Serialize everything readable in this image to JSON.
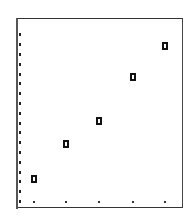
{
  "chart_data": {
    "type": "scatter",
    "title": "",
    "xlabel": "",
    "ylabel": "",
    "x": [
      1,
      2,
      3,
      4,
      5
    ],
    "series": [
      {
        "name": "",
        "values": [
          2,
          6,
          8,
          13,
          16
        ],
        "marker": "hollow-square",
        "color": "#111111"
      }
    ],
    "xlim": [
      0.5,
      5.5
    ],
    "ylim": [
      0,
      18
    ],
    "x_tick_count": 5,
    "y_tick_count": 18,
    "tick_labels_visible": false,
    "grid": false,
    "legend": null,
    "frame_color": "#444444",
    "note": "No tick labels visible; y values are estimated from unlabelled tick spacing"
  }
}
